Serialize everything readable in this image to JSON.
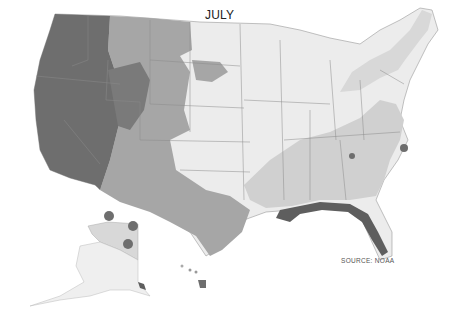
{
  "map": {
    "title": "JULY",
    "source": "SOURCE: NOAA",
    "legend_classes": [
      {
        "name": "highest",
        "color": "#6e6e6e"
      },
      {
        "name": "high",
        "color": "#a6a6a6"
      },
      {
        "name": "moderate",
        "color": "#d0d0d0"
      },
      {
        "name": "low",
        "color": "#ececec"
      }
    ],
    "regions": [
      {
        "name": "west-coast-interior",
        "class": "highest"
      },
      {
        "name": "rocky-mountains",
        "class": "high"
      },
      {
        "name": "great-plains",
        "class": "low"
      },
      {
        "name": "southeast",
        "class": "moderate"
      },
      {
        "name": "gulf-coast-florida",
        "class": "highest"
      },
      {
        "name": "alaska-north",
        "class": "moderate"
      },
      {
        "name": "alaska-south",
        "class": "low"
      },
      {
        "name": "hawaii-big-island",
        "class": "highest"
      }
    ],
    "alaska_markers": 3
  }
}
